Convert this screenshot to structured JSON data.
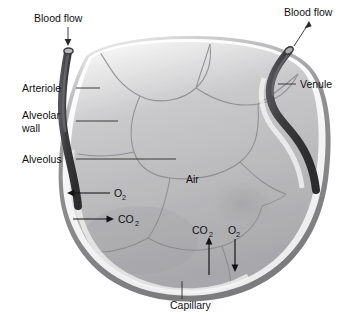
{
  "figure": {
    "background_color": "#ffffff"
  },
  "labels": {
    "blood_flow_in": "Blood flow",
    "blood_flow_out": "Blood flow",
    "arteriole": "Arteriole",
    "alveolar_wall_line1": "Alveolar",
    "alveolar_wall_line2": "wall",
    "alveolus": "Alveolus",
    "air": "Air",
    "venule": "Venule",
    "capillary": "Capillary"
  },
  "gases": {
    "o2_symbol": "O",
    "o2_subscript": "2",
    "co2_symbol": "CO",
    "co2_subscript": "2",
    "left_o2_direction": "left",
    "left_co2_direction": "right",
    "bottom_co2_direction": "up",
    "bottom_o2_direction": "down"
  },
  "colors": {
    "vessel_dark": "#3f3f42",
    "vessel_lumen": "#b9b9bb",
    "wall_outer": "#8e8e90",
    "wall_inner": "#f2f2f2",
    "air_fill": "#b4b4b6",
    "septa_line": "#8a8a8c",
    "text": "#111111",
    "leader": "#2a2a2a"
  }
}
